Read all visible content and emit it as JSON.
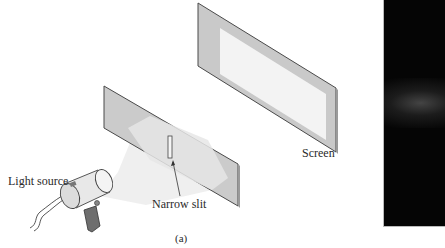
{
  "figure": {
    "panel_label": "(a)",
    "labels": {
      "light_source": "Light source",
      "narrow_slit": "Narrow slit",
      "screen": "Screen"
    },
    "colors": {
      "panel_gray": "#c8c8c8",
      "panel_edge": "#555555",
      "screen_bright_area": "#f2f2f2",
      "light_beam": "#ececec",
      "photo_background": "#050505",
      "photo_band": "#5a5a5a"
    },
    "photo": {
      "description": "Photograph of screen showing single bright band from narrow slit"
    }
  }
}
